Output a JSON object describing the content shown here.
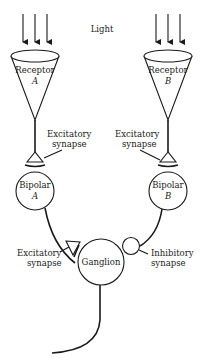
{
  "diagram": {
    "title_label": "Light",
    "receptor_a": {
      "name": "Receptor",
      "letter": "A"
    },
    "receptor_b": {
      "name": "Receptor",
      "letter": "B"
    },
    "synapse_a_top": {
      "line1": "Excitatory",
      "line2": "synapse"
    },
    "synapse_b_top": {
      "line1": "Excitatory",
      "line2": "synapse"
    },
    "bipolar_a": {
      "name": "Bipolar",
      "letter": "A"
    },
    "bipolar_b": {
      "name": "Bipolar",
      "letter": "B"
    },
    "synapse_a_bottom": {
      "line1": "Excitatory",
      "line2": "synapse"
    },
    "synapse_b_bottom": {
      "line1": "Inhibitory",
      "line2": "synapse"
    },
    "ganglion": {
      "name": "Ganglion"
    },
    "colors": {
      "ink": "#1a1a1a",
      "background": "#ffffff"
    }
  }
}
